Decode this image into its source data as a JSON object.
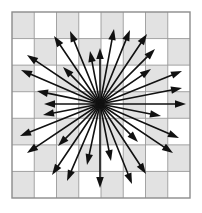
{
  "figure": {
    "background_color": "#ffffff"
  },
  "grid": {
    "x": 12,
    "y": 12,
    "width": 178,
    "height": 186,
    "columns": 8,
    "rows": 7,
    "border_color": "#8c8c8c",
    "border_width": 1.4,
    "line_color": "#9a9a9a",
    "line_width": 0.9,
    "shaded_color": "#e2e2e2",
    "unshaded_color": "#ffffff",
    "checker_parity": 0
  },
  "chart_data": {
    "type": "scatter",
    "xlabel": "",
    "ylabel": "",
    "origin": {
      "x": 100,
      "y": 104
    },
    "arrow_color": "#111111",
    "shaft_width": 1.6,
    "head_length": 11,
    "head_width": 7.5,
    "vectors": [
      {
        "angle_deg": 0,
        "length": 86,
        "tip_x": 186,
        "tip_y": 104
      },
      {
        "angle_deg": 11,
        "length": 84,
        "tip_x": 182,
        "tip_y": 88
      },
      {
        "angle_deg": 22,
        "length": 89,
        "tip_x": 182,
        "tip_y": 71
      },
      {
        "angle_deg": 34,
        "length": 62,
        "tip_x": 151,
        "tip_y": 69
      },
      {
        "angle_deg": 45,
        "length": 78,
        "tip_x": 155,
        "tip_y": 49
      },
      {
        "angle_deg": 56,
        "length": 84,
        "tip_x": 147,
        "tip_y": 34
      },
      {
        "angle_deg": 68,
        "length": 80,
        "tip_x": 130,
        "tip_y": 30
      },
      {
        "angle_deg": 79,
        "length": 76,
        "tip_x": 114,
        "tip_y": 29
      },
      {
        "angle_deg": 90,
        "length": 56,
        "tip_x": 100,
        "tip_y": 48
      },
      {
        "angle_deg": 101,
        "length": 54,
        "tip_x": 90,
        "tip_y": 51
      },
      {
        "angle_deg": 112,
        "length": 79,
        "tip_x": 70,
        "tip_y": 31
      },
      {
        "angle_deg": 124,
        "length": 82,
        "tip_x": 54,
        "tip_y": 36
      },
      {
        "angle_deg": 135,
        "length": 52,
        "tip_x": 63,
        "tip_y": 67
      },
      {
        "angle_deg": 146,
        "length": 88,
        "tip_x": 27,
        "tip_y": 55
      },
      {
        "angle_deg": 157,
        "length": 86,
        "tip_x": 21,
        "tip_y": 70
      },
      {
        "angle_deg": 168,
        "length": 64,
        "tip_x": 37,
        "tip_y": 91
      },
      {
        "angle_deg": 180,
        "length": 56,
        "tip_x": 44,
        "tip_y": 104
      },
      {
        "angle_deg": 191,
        "length": 58,
        "tip_x": 43,
        "tip_y": 115
      },
      {
        "angle_deg": 202,
        "length": 86,
        "tip_x": 20,
        "tip_y": 136
      },
      {
        "angle_deg": 214,
        "length": 88,
        "tip_x": 27,
        "tip_y": 153
      },
      {
        "angle_deg": 225,
        "length": 60,
        "tip_x": 58,
        "tip_y": 146
      },
      {
        "angle_deg": 236,
        "length": 86,
        "tip_x": 52,
        "tip_y": 175
      },
      {
        "angle_deg": 247,
        "length": 84,
        "tip_x": 67,
        "tip_y": 181
      },
      {
        "angle_deg": 258,
        "length": 62,
        "tip_x": 87,
        "tip_y": 165
      },
      {
        "angle_deg": 270,
        "length": 84,
        "tip_x": 100,
        "tip_y": 188
      },
      {
        "angle_deg": 281,
        "length": 58,
        "tip_x": 111,
        "tip_y": 161
      },
      {
        "angle_deg": 292,
        "length": 86,
        "tip_x": 132,
        "tip_y": 184
      },
      {
        "angle_deg": 303,
        "length": 84,
        "tip_x": 146,
        "tip_y": 174
      },
      {
        "angle_deg": 315,
        "length": 54,
        "tip_x": 138,
        "tip_y": 142
      },
      {
        "angle_deg": 326,
        "length": 88,
        "tip_x": 173,
        "tip_y": 153
      },
      {
        "angle_deg": 337,
        "length": 86,
        "tip_x": 179,
        "tip_y": 138
      },
      {
        "angle_deg": 349,
        "length": 62,
        "tip_x": 161,
        "tip_y": 116
      }
    ]
  }
}
